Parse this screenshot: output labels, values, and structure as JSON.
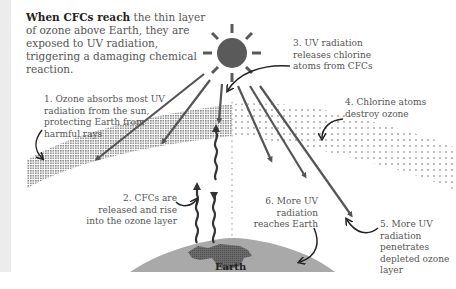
{
  "intro": {
    "bold": "When CFCs reach",
    "rest": " the thin layer of ozone above Earth, they are exposed to UV radiation, triggering a damaging chemical reaction."
  },
  "steps": [
    {
      "number": 1,
      "text": "1. Ozone absorbs most UV radiation from the sun, protecting Earth from harmful rays"
    },
    {
      "number": 2,
      "text": "2. CFCs are released and rise into the ozone layer"
    },
    {
      "number": 3,
      "text": "3. UV radiation releases chlorine atoms from CFCs"
    },
    {
      "number": 4,
      "text": "4. Chlorine atoms destroy ozone"
    },
    {
      "number": 5,
      "text": "5. More UV radiation penetrates depleted ozone layer"
    },
    {
      "number": 6,
      "text": "6. More UV radiation reaches Earth"
    }
  ],
  "earth": {
    "label": "Earth"
  },
  "colors": {
    "sun": "#5a5a5a",
    "arrow": "#555555",
    "ozone_dense": "#8a8a8a",
    "ozone_depleted": "#a8a8a8",
    "earth": "#a9a9a9",
    "continent": "#666666",
    "sidebar": "#ececec"
  }
}
